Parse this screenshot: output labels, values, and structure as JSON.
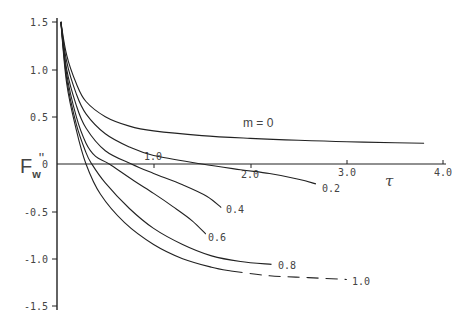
{
  "chart_data": {
    "type": "line",
    "title": "",
    "xlabel": "τ",
    "ylabel": "F_w''",
    "xlim": [
      0,
      4.0
    ],
    "ylim": [
      -1.5,
      1.5
    ],
    "grid": false,
    "x_ticks": [
      "1.0",
      "2.0",
      "3.0",
      "4.0"
    ],
    "y_ticks": [
      "1.5",
      "1.0",
      "0.5",
      "0",
      "-0.5",
      "-1.0",
      "-1.5"
    ],
    "legend_title": "m = 0",
    "series": [
      {
        "name": "m = 0",
        "label": "m = 0",
        "dashed_after": null,
        "points": [
          [
            0.04,
            1.5
          ],
          [
            0.1,
            1.15
          ],
          [
            0.2,
            0.85
          ],
          [
            0.3,
            0.66
          ],
          [
            0.5,
            0.5
          ],
          [
            0.75,
            0.4
          ],
          [
            1.0,
            0.35
          ],
          [
            1.5,
            0.3
          ],
          [
            2.0,
            0.27
          ],
          [
            2.5,
            0.25
          ],
          [
            3.0,
            0.235
          ],
          [
            3.5,
            0.225
          ],
          [
            3.8,
            0.22
          ]
        ]
      },
      {
        "name": "m = 0.2",
        "label": "0.2",
        "dashed_after": null,
        "points": [
          [
            0.04,
            1.5
          ],
          [
            0.1,
            1.08
          ],
          [
            0.2,
            0.74
          ],
          [
            0.3,
            0.53
          ],
          [
            0.5,
            0.32
          ],
          [
            0.75,
            0.18
          ],
          [
            1.0,
            0.09
          ],
          [
            1.5,
            0.0
          ],
          [
            1.9,
            -0.06
          ],
          [
            2.2,
            -0.1
          ],
          [
            2.5,
            -0.16
          ],
          [
            2.68,
            -0.21
          ]
        ]
      },
      {
        "name": "m = 0.4",
        "label": "0.4",
        "dashed_after": null,
        "points": [
          [
            0.04,
            1.5
          ],
          [
            0.1,
            1.0
          ],
          [
            0.2,
            0.62
          ],
          [
            0.3,
            0.38
          ],
          [
            0.5,
            0.14
          ],
          [
            0.77,
            0.0
          ],
          [
            1.0,
            -0.1
          ],
          [
            1.3,
            -0.22
          ],
          [
            1.55,
            -0.34
          ],
          [
            1.7,
            -0.46
          ]
        ]
      },
      {
        "name": "m = 0.6",
        "label": "0.6",
        "dashed_after": null,
        "points": [
          [
            0.04,
            1.5
          ],
          [
            0.1,
            0.95
          ],
          [
            0.2,
            0.5
          ],
          [
            0.3,
            0.22
          ],
          [
            0.4,
            0.08
          ],
          [
            0.54,
            0.0
          ],
          [
            0.8,
            -0.18
          ],
          [
            1.0,
            -0.31
          ],
          [
            1.2,
            -0.45
          ],
          [
            1.4,
            -0.6
          ],
          [
            1.54,
            -0.74
          ]
        ]
      },
      {
        "name": "m = 0.8",
        "label": "0.8",
        "dashed_after": null,
        "points": [
          [
            0.04,
            1.5
          ],
          [
            0.1,
            0.9
          ],
          [
            0.2,
            0.42
          ],
          [
            0.3,
            0.12
          ],
          [
            0.36,
            0.0
          ],
          [
            0.5,
            -0.2
          ],
          [
            0.75,
            -0.47
          ],
          [
            1.0,
            -0.68
          ],
          [
            1.3,
            -0.85
          ],
          [
            1.6,
            -0.97
          ],
          [
            1.9,
            -1.03
          ],
          [
            2.22,
            -1.06
          ]
        ]
      },
      {
        "name": "m = 1.0",
        "label": "1.0",
        "dashed_after": 1.8,
        "points": [
          [
            0.04,
            1.5
          ],
          [
            0.1,
            0.85
          ],
          [
            0.2,
            0.36
          ],
          [
            0.3,
            0.0
          ],
          [
            0.45,
            -0.32
          ],
          [
            0.7,
            -0.62
          ],
          [
            1.0,
            -0.85
          ],
          [
            1.3,
            -1.0
          ],
          [
            1.6,
            -1.09
          ],
          [
            1.8,
            -1.13
          ],
          [
            2.2,
            -1.18
          ],
          [
            2.6,
            -1.2
          ],
          [
            3.0,
            -1.22
          ]
        ]
      }
    ],
    "annotations": [
      {
        "text": "m = 0",
        "x": 2.0,
        "y": 0.35
      },
      {
        "text": "1.0",
        "x": 0.9,
        "y": 0.08
      },
      {
        "text": "2.0",
        "x": 1.92,
        "y": -0.12
      },
      {
        "text": "0.2",
        "x": 2.75,
        "y": -0.26
      },
      {
        "text": "0.4",
        "x": 1.76,
        "y": -0.51
      },
      {
        "text": "0.6",
        "x": 1.55,
        "y": -0.8
      },
      {
        "text": "0.8",
        "x": 2.35,
        "y": -1.06
      },
      {
        "text": "1.0",
        "x": 3.1,
        "y": -1.22
      }
    ]
  },
  "labels": {
    "y_axis": "F",
    "y_axis_sub": "w",
    "y_axis_sup": "''",
    "x_axis": "τ",
    "m0": "m = 0",
    "c02": "0.2",
    "c04": "0.4",
    "c06": "0.6",
    "c08": "0.8",
    "c10": "1.0",
    "x1": "1.0",
    "x2": "2.0",
    "x3": "3.0",
    "x4": "4.0",
    "y15": "1.5",
    "y10": "1.0",
    "y05": "0.5",
    "y0": "0",
    "ym05": "-0.5",
    "ym10": "-1.0",
    "ym15": "-1.5"
  }
}
